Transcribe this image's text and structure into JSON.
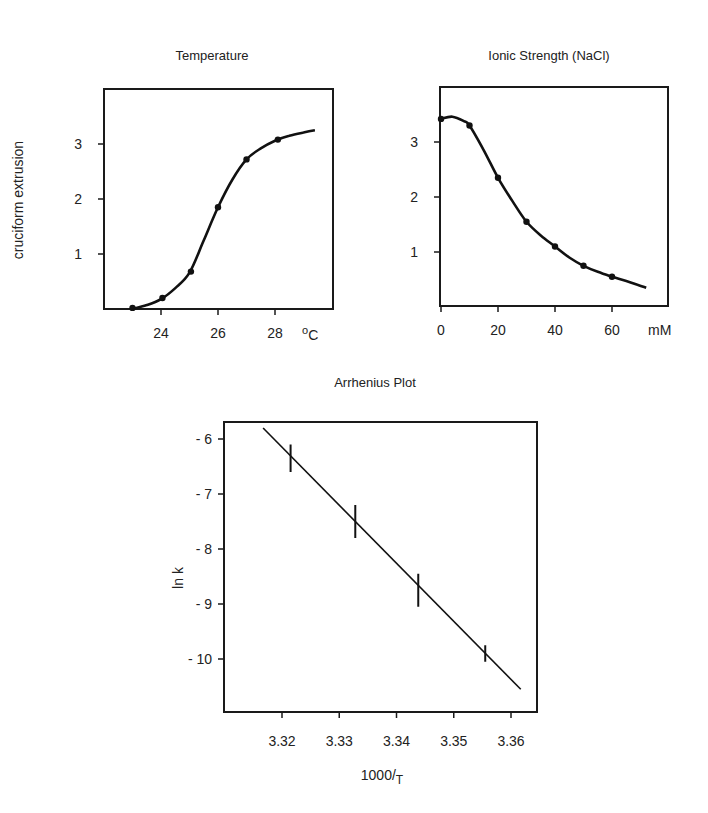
{
  "chart_data": [
    {
      "type": "line",
      "title": "Temperature",
      "xlabel": "°C",
      "ylabel": "cruciform extrusion",
      "xticks": [
        "24",
        "26",
        "28"
      ],
      "yticks": [
        "1",
        "2",
        "3"
      ],
      "xlim": [
        22,
        30
      ],
      "ylim": [
        0,
        3.8
      ],
      "grid": false,
      "series": [
        {
          "name": "data points",
          "x": [
            23,
            24.05,
            25.05,
            26,
            27,
            28.1
          ],
          "y": [
            0.02,
            0.2,
            0.68,
            1.85,
            2.72,
            3.08
          ]
        },
        {
          "name": "fitted curve",
          "x": [
            23,
            23.5,
            24,
            24.5,
            25,
            25.5,
            26,
            26.5,
            27,
            27.5,
            28,
            28.5,
            29,
            29.4
          ],
          "y": [
            0.0,
            0.07,
            0.18,
            0.38,
            0.66,
            1.25,
            1.85,
            2.35,
            2.72,
            2.92,
            3.06,
            3.15,
            3.21,
            3.25
          ]
        }
      ]
    },
    {
      "type": "line",
      "title": "Ionic Strength (NaCl)",
      "xlabel": "mM",
      "ylabel": "",
      "xticks": [
        "0",
        "20",
        "40",
        "60"
      ],
      "yticks": [
        "1",
        "2",
        "3"
      ],
      "xlim": [
        0,
        79
      ],
      "ylim": [
        0,
        4
      ],
      "grid": false,
      "series": [
        {
          "name": "data points",
          "x": [
            0,
            10,
            20,
            30,
            40,
            50,
            60
          ],
          "y": [
            3.42,
            3.3,
            2.35,
            1.55,
            1.1,
            0.75,
            0.55
          ]
        },
        {
          "name": "fitted curve",
          "x": [
            0,
            4,
            8,
            10,
            15,
            20,
            25,
            30,
            35,
            40,
            45,
            50,
            55,
            60,
            65,
            72
          ],
          "y": [
            3.42,
            3.46,
            3.38,
            3.3,
            2.85,
            2.35,
            1.93,
            1.55,
            1.3,
            1.1,
            0.9,
            0.75,
            0.64,
            0.55,
            0.47,
            0.35
          ]
        }
      ]
    },
    {
      "type": "line",
      "title": "Arrhenius Plot",
      "xlabel": "1000/T",
      "ylabel": "ln k",
      "xticks": [
        "3.32",
        "3.33",
        "3.34",
        "3.35",
        "3.36"
      ],
      "yticks": [
        "-6",
        "-7",
        "-8",
        "-9",
        "-10"
      ],
      "xlim": [
        3.3115,
        3.3655
      ],
      "ylim": [
        -11.3,
        -5.7
      ],
      "grid": false,
      "series": [
        {
          "name": "data points (with error bars)",
          "x": [
            3.3215,
            3.3328,
            3.3438,
            3.3555
          ],
          "y": [
            -6.35,
            -7.5,
            -8.75,
            -9.9
          ],
          "error": [
            0.25,
            0.3,
            0.3,
            0.15
          ]
        },
        {
          "name": "linear fit",
          "x": [
            3.3167,
            3.3617
          ],
          "y": [
            -5.8,
            -10.55
          ]
        }
      ]
    }
  ]
}
